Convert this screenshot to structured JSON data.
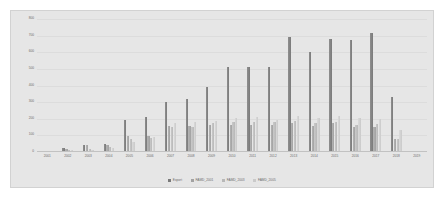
{
  "chart_data": {
    "type": "bar",
    "title": "",
    "xlabel": "",
    "ylabel": "",
    "ylim": [
      0,
      800
    ],
    "grid": true,
    "legend_position": "bottom",
    "categories": [
      "2001",
      "2002",
      "2003",
      "2004",
      "2005",
      "2006",
      "2007",
      "2008",
      "2009",
      "2010",
      "2011",
      "2012",
      "2013",
      "2014",
      "2015",
      "2016",
      "2017",
      "2018",
      "2019"
    ],
    "ytick_labels": [
      "0",
      "100",
      "200",
      "300",
      "400",
      "500",
      "600",
      "700",
      "800"
    ],
    "ytick_values": [
      0,
      100,
      200,
      300,
      400,
      500,
      600,
      700,
      800
    ],
    "series": [
      {
        "name": "Export",
        "color": "#7a7a7a",
        "values": [
          8,
          22,
          45,
          48,
          190,
          210,
          298,
          320,
          390,
          510,
          510,
          512,
          690,
          600,
          680,
          675,
          715,
          330,
          5
        ]
      },
      {
        "name": "FAMD_2001",
        "color": "#a2a2a2",
        "values": [
          6,
          18,
          40,
          42,
          95,
          96,
          155,
          158,
          160,
          162,
          162,
          160,
          172,
          158,
          172,
          150,
          152,
          78,
          3
        ]
      },
      {
        "name": "FAMD_2003",
        "color": "#b8b8b8",
        "values": [
          4,
          14,
          20,
          30,
          80,
          85,
          150,
          152,
          175,
          180,
          182,
          180,
          185,
          175,
          178,
          162,
          168,
          80,
          2
        ]
      },
      {
        "name": "FAMD_2005",
        "color": "#cacaca",
        "values": [
          3,
          10,
          15,
          22,
          60,
          92,
          175,
          178,
          185,
          205,
          208,
          195,
          215,
          205,
          218,
          205,
          200,
          130,
          2
        ]
      }
    ]
  }
}
